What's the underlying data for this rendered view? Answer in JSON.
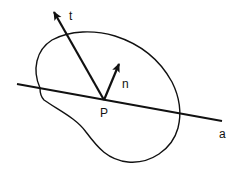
{
  "diagram": {
    "labels": {
      "tangent_vector": "t",
      "normal_vector": "n",
      "point": "P",
      "line": "a"
    },
    "colors": {
      "stroke": "#111111",
      "background": "#ffffff"
    }
  }
}
